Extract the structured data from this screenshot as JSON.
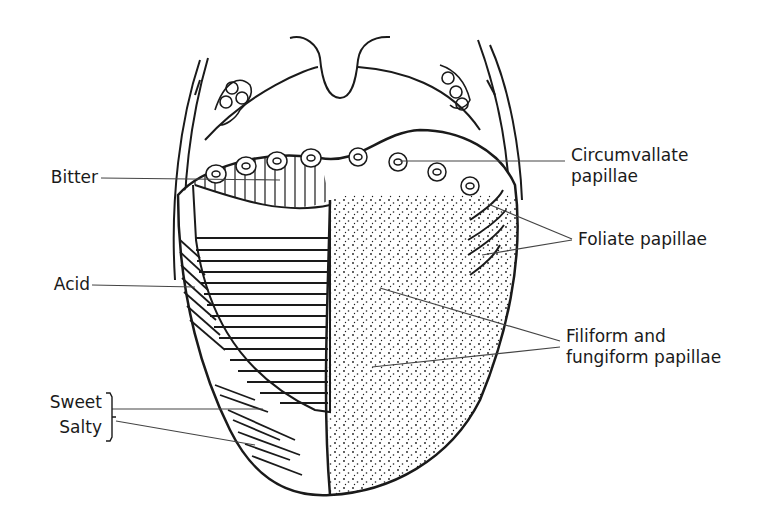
{
  "diagram": {
    "colors": {
      "ink": "#1a1a1a",
      "leader": "#444444",
      "background": "#ffffff"
    },
    "labels_left": [
      {
        "id": "bitter",
        "text": "Bitter"
      },
      {
        "id": "acid",
        "text": "Acid"
      },
      {
        "id": "sweet",
        "text": "Sweet"
      },
      {
        "id": "salty",
        "text": "Salty"
      }
    ],
    "labels_right": [
      {
        "id": "circumvallate",
        "line1": "Circumvallate",
        "line2": "papillae"
      },
      {
        "id": "foliate",
        "line1": "Foliate papillae"
      },
      {
        "id": "filiform",
        "line1": "Filiform and",
        "line2": "fungiform papillae"
      }
    ]
  }
}
